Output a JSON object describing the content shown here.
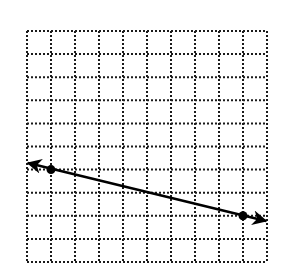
{
  "diagram": {
    "type": "coordinate-grid-line",
    "grid": {
      "columns": 10,
      "rows": 10,
      "origin_px": [
        27,
        31
      ],
      "cell_width_px": 24,
      "cell_height_px": 23.1,
      "line_style": "dotted",
      "line_color": "#1a1a1a"
    },
    "line": {
      "color": "#000000",
      "arrows": "both",
      "points": [
        {
          "label": "A",
          "grid": [
            1,
            6
          ]
        },
        {
          "label": "B",
          "grid": [
            9,
            8
          ]
        }
      ],
      "arrow_tips_px": [
        [
          28,
          163
        ],
        [
          266,
          221
        ]
      ]
    }
  }
}
